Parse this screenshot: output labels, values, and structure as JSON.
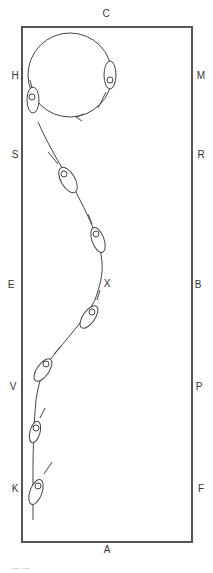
{
  "diagram": {
    "type": "dressage-arena",
    "arena": {
      "left": 22,
      "top": 27,
      "right": 192,
      "bottom": 542,
      "stroke": "#555555"
    },
    "letters": [
      {
        "id": "C",
        "label": "C",
        "x": 106,
        "y": 14
      },
      {
        "id": "H",
        "label": "H",
        "x": 15,
        "y": 76
      },
      {
        "id": "M",
        "label": "M",
        "x": 201,
        "y": 76
      },
      {
        "id": "S",
        "label": "S",
        "x": 15,
        "y": 155
      },
      {
        "id": "R",
        "label": "R",
        "x": 201,
        "y": 155
      },
      {
        "id": "E",
        "label": "E",
        "x": 11,
        "y": 285
      },
      {
        "id": "B",
        "label": "B",
        "x": 198,
        "y": 285
      },
      {
        "id": "X",
        "label": "X",
        "x": 107,
        "y": 284
      },
      {
        "id": "V",
        "label": "V",
        "x": 13,
        "y": 387
      },
      {
        "id": "P",
        "label": "P",
        "x": 199,
        "y": 387
      },
      {
        "id": "K",
        "label": "K",
        "x": 15,
        "y": 489
      },
      {
        "id": "F",
        "label": "F",
        "x": 201,
        "y": 489
      },
      {
        "id": "A",
        "label": "A",
        "x": 107,
        "y": 550
      }
    ],
    "path_description": "Volte circle at H, then serpentine-like path down through X toward K",
    "caption": "— —"
  }
}
